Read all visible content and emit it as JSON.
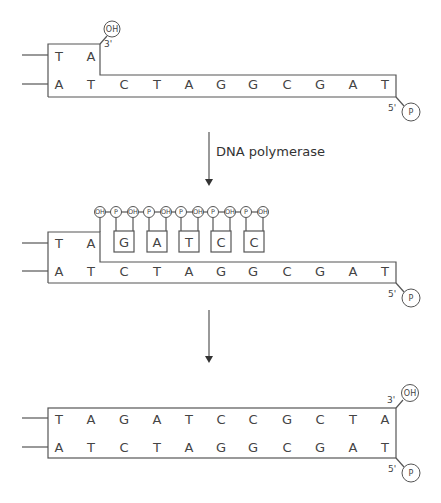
{
  "step1": {
    "primer_bases": [
      "T",
      "A"
    ],
    "template_bases": [
      "A",
      "T",
      "C",
      "T",
      "A",
      "G",
      "G",
      "C",
      "G",
      "A",
      "T"
    ],
    "primer_3_end": {
      "label": "3'",
      "group": "OH"
    },
    "template_5_end": {
      "label": "5'",
      "group": "P"
    }
  },
  "arrow1": {
    "label": "DNA polymerase"
  },
  "step2": {
    "primer_bases": [
      "T",
      "A"
    ],
    "incoming_nucleotides": [
      "G",
      "A",
      "T",
      "C",
      "C"
    ],
    "chain_groups": [
      "OH",
      "P",
      "OH",
      "P",
      "OH",
      "P",
      "OH",
      "P",
      "OH",
      "P",
      "OH"
    ],
    "template_bases": [
      "A",
      "T",
      "C",
      "T",
      "A",
      "G",
      "G",
      "C",
      "G",
      "A",
      "T"
    ],
    "template_5_end": {
      "label": "5'",
      "group": "P"
    }
  },
  "step3": {
    "new_strand_bases": [
      "T",
      "A",
      "G",
      "A",
      "T",
      "C",
      "C",
      "G",
      "C",
      "T",
      "A"
    ],
    "template_bases": [
      "A",
      "T",
      "C",
      "T",
      "A",
      "G",
      "G",
      "C",
      "G",
      "A",
      "T"
    ],
    "new_strand_3_end": {
      "label": "3'",
      "group": "OH"
    },
    "template_5_end": {
      "label": "5'",
      "group": "P"
    }
  }
}
